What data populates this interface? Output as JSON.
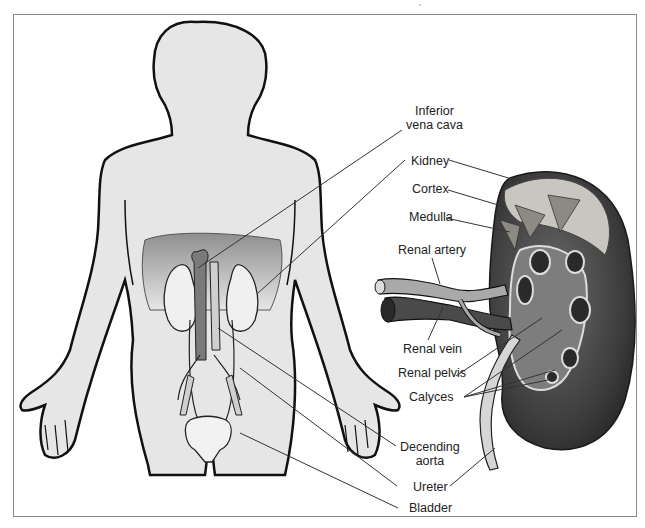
{
  "figure": {
    "type": "anatomical-diagram",
    "colors": {
      "frame": "#8a8a8a",
      "body_fill": "#e6e6e6",
      "body_outline": "#111111",
      "abdomen_shade": "#9e9e9e",
      "vena_cava": "#7a7a7a",
      "kidney_dark": "#3a3a3a",
      "kidney_cortex": "#c9c6c0",
      "leader_line": "#333333"
    }
  },
  "labels": {
    "inferior_vena_cava": {
      "line1": "Inferior",
      "line2": "vena cava"
    },
    "kidney": "Kidney",
    "cortex": "Cortex",
    "medulla": "Medulla",
    "renal_artery": "Renal artery",
    "renal_vein": "Renal vein",
    "renal_pelvis": "Renal pelvis",
    "calyces": "Calyces",
    "descending_aorta": {
      "line1": "Decending",
      "line2": "aorta"
    },
    "ureter": "Ureter",
    "bladder": "Bladder"
  }
}
